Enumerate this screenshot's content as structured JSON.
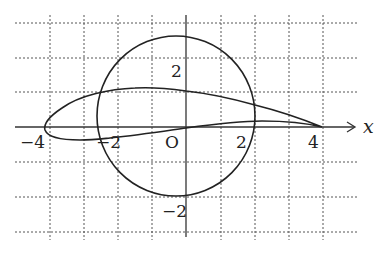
{
  "figure": {
    "axis_label_x": "x",
    "origin_label": "O",
    "x_tick_labels": [
      "−4",
      "−2",
      "2",
      "4"
    ],
    "y_tick_labels": [
      "2",
      "−2"
    ],
    "grid": {
      "x_range": [
        -4,
        4
      ],
      "y_range": [
        -3,
        3
      ],
      "step": 1,
      "style": "dotted"
    },
    "curves": [
      {
        "name": "circle",
        "center": [
          -0.3,
          0.3
        ],
        "radius": 2.3
      },
      {
        "name": "airfoil",
        "leading_edge": [
          -4.1,
          0
        ],
        "trailing_edge": [
          4,
          0
        ],
        "max_thickness_near_x": -1
      }
    ],
    "colors": {
      "line": "#222222",
      "grid": "#555555",
      "background": "#ffffff"
    }
  }
}
